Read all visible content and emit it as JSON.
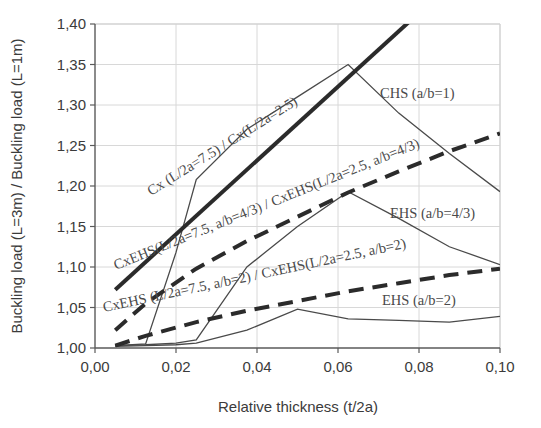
{
  "chart_data": {
    "type": "line",
    "title": "",
    "xlabel": "Relative thickness (t/2a)",
    "ylabel": "Buckling load (L=3m) / Buckling load (L=1m)",
    "xlim": [
      0.0,
      0.1
    ],
    "ylim": [
      1.0,
      1.4
    ],
    "xticks": [
      0.0,
      0.02,
      0.04,
      0.06,
      0.08,
      0.1
    ],
    "xticklabels": [
      "0,00",
      "0,02",
      "0,04",
      "0,06",
      "0,08",
      "0,10"
    ],
    "yticks": [
      1.0,
      1.05,
      1.1,
      1.15,
      1.2,
      1.25,
      1.3,
      1.35,
      1.4
    ],
    "yticklabels": [
      "1,00",
      "1,05",
      "1,10",
      "1,15",
      "1,20",
      "1,25",
      "1,30",
      "1,35",
      "1,40"
    ],
    "grid": true,
    "grid_color": "#d8d8d8",
    "legend": "inline-annotations",
    "series": [
      {
        "name": "CHS (a/b=1)",
        "style": "thin-solid",
        "color": "#4a4a4a",
        "width": 1.3,
        "x": [
          0.005,
          0.0125,
          0.02,
          0.025,
          0.0375,
          0.05,
          0.0625,
          0.075,
          0.0875,
          0.1
        ],
        "y": [
          1.003,
          1.005,
          1.118,
          1.208,
          1.27,
          1.31,
          1.35,
          1.29,
          1.24,
          1.193
        ]
      },
      {
        "name": "EHS (a/b=4/3)",
        "style": "thin-solid",
        "color": "#4a4a4a",
        "width": 1.3,
        "x": [
          0.005,
          0.0125,
          0.02,
          0.025,
          0.0375,
          0.05,
          0.0625,
          0.075,
          0.0875,
          0.1
        ],
        "y": [
          1.003,
          1.004,
          1.006,
          1.01,
          1.1,
          1.15,
          1.193,
          1.16,
          1.125,
          1.103
        ]
      },
      {
        "name": "EHS (a/b=2)",
        "style": "thin-solid",
        "color": "#4a4a4a",
        "width": 1.3,
        "x": [
          0.005,
          0.0125,
          0.02,
          0.025,
          0.0375,
          0.05,
          0.0625,
          0.075,
          0.0875,
          0.1
        ],
        "y": [
          1.002,
          1.003,
          1.004,
          1.006,
          1.022,
          1.048,
          1.036,
          1.034,
          1.032,
          1.039
        ]
      },
      {
        "name": "Cx (L/2a=7.5) / Cx(L/2a=2.5)",
        "style": "thick-solid",
        "color": "#2b2b2b",
        "width": 4.0,
        "x": [
          0.005,
          0.1
        ],
        "y": [
          1.072,
          1.505
        ]
      },
      {
        "name": "CxEHS(L/2a=7.5, a/b=4/3) / CxEHS(L/2a=2.5, a/b=4/3)",
        "style": "thick-dashed",
        "color": "#2b2b2b",
        "width": 4.0,
        "x": [
          0.005,
          0.0125,
          0.025,
          0.0375,
          0.05,
          0.0625,
          0.075,
          0.0875,
          0.1
        ],
        "y": [
          1.022,
          1.055,
          1.098,
          1.132,
          1.162,
          1.192,
          1.218,
          1.243,
          1.265
        ]
      },
      {
        "name": "CxEHS (L/2a=7.5, a/b=2) / CxEHS(L/2a=2.5, a/b=2)",
        "style": "thick-dashed",
        "color": "#2b2b2b",
        "width": 4.0,
        "x": [
          0.005,
          0.0125,
          0.025,
          0.0375,
          0.05,
          0.0625,
          0.075,
          0.0875,
          0.1
        ],
        "y": [
          1.003,
          1.015,
          1.032,
          1.046,
          1.058,
          1.07,
          1.08,
          1.09,
          1.098
        ]
      }
    ],
    "annotations": [
      {
        "id": "cx-ratio-label",
        "text": "Cx (L/2a=7.5) / Cx(L/2a=2.5)",
        "x": 151,
        "y": 196,
        "rotate": -32
      },
      {
        "id": "cxehs43-label",
        "text": "CxEHS(L/2a=7.5, a/b=4/3) / CxEHS(L/2a=2.5, a/b=4/3)",
        "x": 116,
        "y": 270,
        "rotate": -22
      },
      {
        "id": "cxehs2-label",
        "text": "CxEHS (L/2a=7.5, a/b=2) / CxEHS(L/2a=2.5, a/b=2)",
        "x": 104,
        "y": 312,
        "rotate": -12
      },
      {
        "id": "chs-label",
        "text": "CHS (a/b=1)",
        "x": 380,
        "y": 98,
        "rotate": 0
      },
      {
        "id": "ehs43-label",
        "text": "EHS (a/b=4/3)",
        "x": 390,
        "y": 218,
        "rotate": 0
      },
      {
        "id": "ehs2-label",
        "text": "EHS (a/b=2)",
        "x": 382,
        "y": 305,
        "rotate": 0
      }
    ]
  }
}
